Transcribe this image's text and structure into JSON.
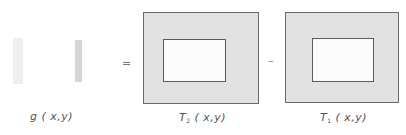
{
  "equation": {
    "operator_equals": "=",
    "operator_minus": "–",
    "terms": [
      {
        "id": "g",
        "func": "g",
        "sub": "",
        "args": "( x,y)"
      },
      {
        "id": "T2",
        "func": "T",
        "sub": "2",
        "args": "( x,y)"
      },
      {
        "id": "T1",
        "func": "T",
        "sub": "1",
        "args": "( x,y)"
      }
    ]
  },
  "colors": {
    "outer_fill": "#e2e2e2",
    "inner_fill": "#fbfbfb",
    "border": "#6a6a6a",
    "g_strip": "#d6d6d6"
  }
}
